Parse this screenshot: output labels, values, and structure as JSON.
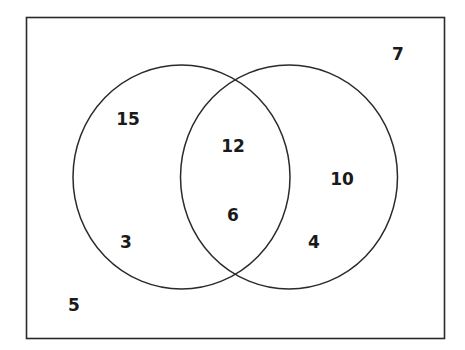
{
  "venn": {
    "universe_outside": "5",
    "outside_top_right": "7",
    "left_only_top": "15",
    "left_only_bottom": "3",
    "intersection_top": "12",
    "intersection_bottom": "6",
    "right_only_top": "10",
    "right_only_bottom": "4"
  },
  "colors": {
    "stroke": "#2a2a2a",
    "background": "#ffffff"
  }
}
